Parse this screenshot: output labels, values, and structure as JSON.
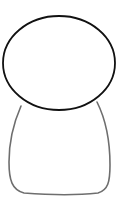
{
  "figure": {
    "description": "Simple outline drawing of a figure: oval head on a rounded body",
    "colors": {
      "background": "#ffffff",
      "head_stroke": "#111111",
      "body_stroke": "#6e6e6e"
    }
  }
}
